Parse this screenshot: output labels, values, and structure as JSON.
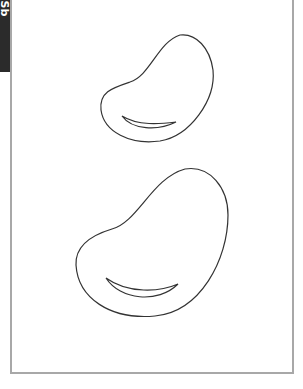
{
  "side_tab": {
    "label": "Sb",
    "background": "#2b2b2b",
    "text_color": "#ffffff"
  },
  "frame": {
    "border_color": "#a8a8a8"
  },
  "figures": [
    {
      "name": "small-bean-shape",
      "stroke": "#333333"
    },
    {
      "name": "large-bean-shape",
      "stroke": "#333333"
    }
  ]
}
